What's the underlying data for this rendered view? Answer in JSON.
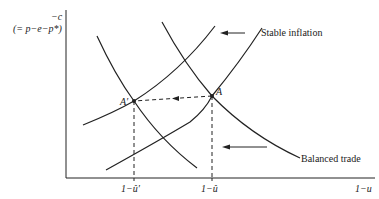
{
  "diagram": {
    "y_axis": {
      "label_top": "−c",
      "label_sub": "(= p−e−p*)"
    },
    "x_axis": {
      "label": "1−u",
      "ticks": [
        "1−û′",
        "1−û"
      ]
    },
    "curves": {
      "stable_inflation": "Stable inflation",
      "balanced_trade": "Balanced trade"
    },
    "points": {
      "a_prime": "A′",
      "a": "A"
    },
    "colors": {
      "line": "#222222",
      "background": "#ffffff"
    }
  }
}
